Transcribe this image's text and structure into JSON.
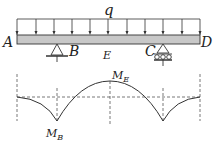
{
  "diagram": {
    "load": {
      "label": "q",
      "arrows": 12
    },
    "points": {
      "A": "A",
      "B": "B",
      "C": "C",
      "D": "D",
      "E": "E"
    },
    "moment": {
      "MB_main": "M",
      "MB_sub": "B",
      "ME_main": "M",
      "ME_sub": "E"
    },
    "colors": {
      "line": "#333333",
      "beam_fill": "#c8c8c8",
      "dash": "#555555"
    }
  }
}
